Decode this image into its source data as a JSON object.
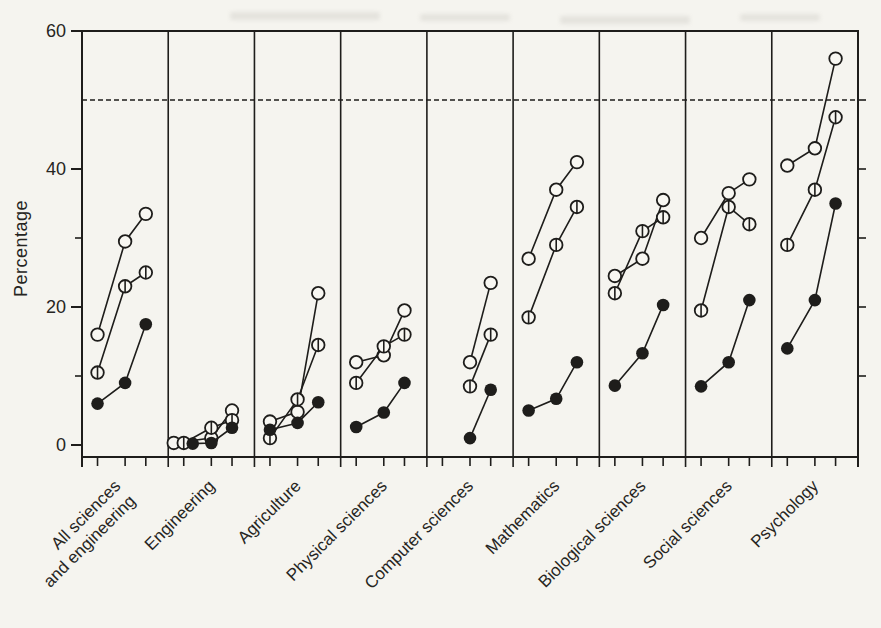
{
  "figure": {
    "kind": "scanned statistical chart, black ink on paper",
    "ylabel": "Percentage"
  },
  "colors": {
    "ink": "#1e1d1b",
    "paper": "#f5f4ef",
    "marker_open_fill": "#f8f7f2"
  },
  "chart_data": {
    "type": "line",
    "title": "",
    "xlabel": "",
    "ylabel": "Percentage",
    "ylim": [
      0,
      60
    ],
    "yticks_labeled": [
      0,
      20,
      40,
      60
    ],
    "yticks_minor_left": [
      10,
      30
    ],
    "yticks_minor_right": [
      10,
      20,
      30,
      40,
      50
    ],
    "reference_line_y": 50,
    "reference_line_style": "dashed",
    "grid": false,
    "legend_position": "none",
    "layout": "nine side-by-side panels sharing one y axis, three unlabeled time points per panel",
    "points_per_panel": 3,
    "categories": [
      "All sciences and engineering",
      "Engineering",
      "Agriculture",
      "Physical sciences",
      "Computer sciences",
      "Mathematics",
      "Biological sciences",
      "Social sciences",
      "Psychology"
    ],
    "category_label_lines": [
      [
        "All sciences",
        "and engineering"
      ],
      [
        "Engineering"
      ],
      [
        "Agriculture"
      ],
      [
        "Physical sciences"
      ],
      [
        "Computer sciences"
      ],
      [
        "Mathematics"
      ],
      [
        "Biological sciences"
      ],
      [
        "Social sciences"
      ],
      [
        "Psychology"
      ]
    ],
    "series": [
      {
        "name": "open-circle series",
        "marker": "open",
        "values_by_category": [
          [
            16,
            29.5,
            33.5
          ],
          [
            0.3,
            1,
            5
          ],
          [
            3.4,
            4.8,
            22
          ],
          [
            12,
            13,
            19.5
          ],
          [
            null,
            12,
            23.5
          ],
          [
            27,
            37,
            41
          ],
          [
            24.5,
            27,
            35.5
          ],
          [
            30,
            36.5,
            38.5
          ],
          [
            40.5,
            43,
            56
          ]
        ],
        "x_jitter_by_category": [
          [
            0,
            0,
            0
          ],
          [
            -10,
            0,
            0
          ],
          [
            0,
            0,
            0
          ],
          [
            0,
            0,
            0
          ],
          [
            0,
            0,
            0
          ],
          [
            0,
            0,
            0
          ],
          [
            0,
            0,
            0
          ],
          [
            0,
            0,
            0
          ],
          [
            0,
            0,
            0
          ]
        ]
      },
      {
        "name": "vertical-line-circle series",
        "marker": "half",
        "values_by_category": [
          [
            10.5,
            23,
            25
          ],
          [
            0.3,
            2.5,
            3.6
          ],
          [
            1,
            6.6,
            14.5
          ],
          [
            9,
            14.3,
            16
          ],
          [
            null,
            8.5,
            16
          ],
          [
            18.5,
            29,
            34.5
          ],
          [
            22,
            31,
            33
          ],
          [
            19.5,
            34.5,
            32
          ],
          [
            29,
            37,
            47.5
          ]
        ],
        "x_jitter_by_category": [
          [
            0,
            0,
            0
          ],
          [
            0,
            0,
            0
          ],
          [
            0,
            0,
            0
          ],
          [
            0,
            0,
            0
          ],
          [
            0,
            0,
            0
          ],
          [
            0,
            0,
            0
          ],
          [
            0,
            0,
            0
          ],
          [
            0,
            0,
            0
          ],
          [
            0,
            0,
            0
          ]
        ]
      },
      {
        "name": "filled-circle series",
        "marker": "filled",
        "values_by_category": [
          [
            6,
            9,
            17.5
          ],
          [
            0.2,
            0.3,
            2.5
          ],
          [
            2.2,
            3.2,
            6.2
          ],
          [
            2.6,
            4.7,
            9
          ],
          [
            null,
            1,
            8
          ],
          [
            5,
            6.7,
            12
          ],
          [
            8.6,
            13.3,
            20.3
          ],
          [
            8.5,
            12,
            21
          ],
          [
            14,
            21,
            35
          ]
        ],
        "x_jitter_by_category": [
          [
            0,
            0,
            0
          ],
          [
            9,
            0,
            0
          ],
          [
            0,
            0,
            0
          ],
          [
            0,
            0,
            0
          ],
          [
            0,
            0,
            0
          ],
          [
            0,
            0,
            0
          ],
          [
            0,
            0,
            0
          ],
          [
            0,
            0,
            0
          ],
          [
            0,
            0,
            0
          ]
        ]
      }
    ]
  }
}
